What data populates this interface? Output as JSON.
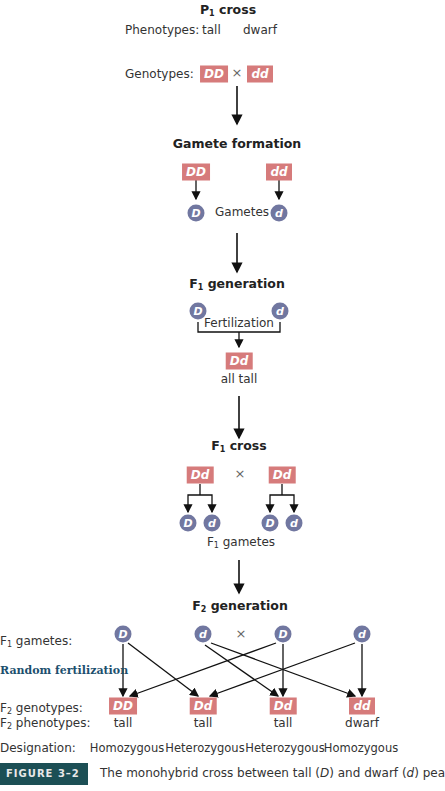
{
  "colors": {
    "genotype_box": "#d67b7b",
    "gamete_circle": "#7177a0",
    "figure_tag_bg": "#1c4f55",
    "random_fertilization": "#1c4f6e"
  },
  "p1": {
    "title_main": "P",
    "title_sub": "1",
    "title_rest": " cross",
    "phenotypes_label": "Phenotypes:",
    "phenotype_1": "tall",
    "phenotype_2": "dwarf",
    "genotypes_label": "Genotypes:",
    "genotype_1": "DD",
    "times": "×",
    "genotype_2": "dd"
  },
  "gamete_formation": {
    "title": "Gamete formation",
    "parent_1": "DD",
    "parent_2": "dd",
    "gamete_1": "D",
    "gamete_2": "d",
    "gametes_label": "Gametes"
  },
  "f1_generation": {
    "title_main": "F",
    "title_sub": "1",
    "title_rest": " generation",
    "gamete_1": "D",
    "gamete_2": "d",
    "fertilization_label": "Fertilization",
    "genotype": "Dd",
    "phenotype": "all tall"
  },
  "f1_cross": {
    "title_main": "F",
    "title_sub": "1",
    "title_rest": " cross",
    "parent_1": "Dd",
    "times": "×",
    "parent_2": "Dd",
    "gametes": [
      "D",
      "d",
      "D",
      "d"
    ],
    "gametes_label_main": "F",
    "gametes_label_sub": "1",
    "gametes_label_rest": " gametes"
  },
  "f2_generation": {
    "title_main": "F",
    "title_sub": "2",
    "title_rest": " generation",
    "f1_gametes_label_main": "F",
    "f1_gametes_label_sub": "1",
    "f1_gametes_label_rest": " gametes:",
    "gametes": [
      "D",
      "d",
      "D",
      "d"
    ],
    "times": "×",
    "random_fertilization": "Random fertilization",
    "genotypes_label_main": "F",
    "genotypes_label_sub": "2",
    "genotypes_label_rest": " genotypes:",
    "phenotypes_label_main": "F",
    "phenotypes_label_sub": "2",
    "phenotypes_label_rest": " phenotypes:",
    "genotypes": [
      "DD",
      "Dd",
      "Dd",
      "dd"
    ],
    "phenotypes": [
      "tall",
      "tall",
      "tall",
      "dwarf"
    ],
    "designation_label": "Designation:",
    "designations": [
      "Homozygous",
      "Heterozygous",
      "Heterozygous",
      "Homozygous"
    ]
  },
  "caption": {
    "figure_tag": "FIGURE 3–2",
    "text_1": "The monohybrid cross between tall (",
    "text_D": "D",
    "text_2": ") and dwarf (",
    "text_d": "d",
    "text_3": ") pea"
  }
}
